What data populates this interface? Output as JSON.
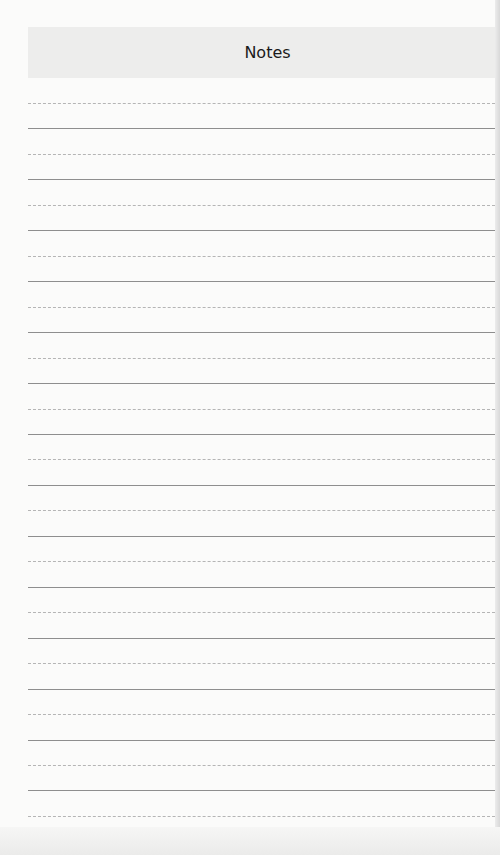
{
  "header": {
    "title": "Notes"
  },
  "ruled_lines": {
    "count": 29,
    "first_y": 103,
    "spacing": 25.46,
    "color": "#8e8e8e"
  },
  "colors": {
    "page_background": "#fbfbfa",
    "header_background": "#ededec",
    "title_text": "#1a1a1a"
  }
}
